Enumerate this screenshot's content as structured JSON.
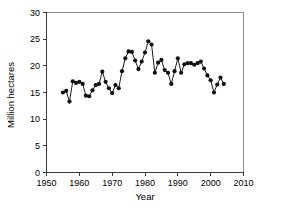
{
  "chart_data": {
    "type": "line",
    "title": "",
    "xlabel": "Year",
    "ylabel": "Million hectares",
    "xlim": [
      1950,
      2010
    ],
    "ylim": [
      0,
      30
    ],
    "xticks": [
      1950,
      1960,
      1970,
      1980,
      1990,
      2000,
      2010
    ],
    "xtick_labels": [
      "1950",
      "1960",
      "1970",
      "1980",
      "1990",
      "2000",
      "2010"
    ],
    "yticks": [
      0,
      5,
      10,
      15,
      20,
      25,
      30
    ],
    "ytick_labels": [
      "0",
      "5",
      "10",
      "15",
      "20",
      "25",
      "30"
    ],
    "grid": false,
    "legend": null,
    "marker": "filled-circle",
    "line_color": "#1a1a1a",
    "marker_color": "#111111",
    "series": [
      {
        "name": "Area harvested",
        "x": [
          1955,
          1956,
          1957,
          1958,
          1959,
          1960,
          1961,
          1962,
          1963,
          1964,
          1965,
          1966,
          1967,
          1968,
          1969,
          1970,
          1971,
          1972,
          1973,
          1974,
          1975,
          1976,
          1977,
          1978,
          1979,
          1980,
          1981,
          1982,
          1983,
          1984,
          1985,
          1986,
          1987,
          1988,
          1989,
          1990,
          1991,
          1992,
          1993,
          1994,
          1995,
          1996,
          1997,
          1998,
          1999,
          2000,
          2001,
          2002,
          2003,
          2004
        ],
        "values": [
          15.0,
          15.3,
          13.3,
          17.1,
          16.8,
          17.0,
          16.6,
          14.4,
          14.3,
          15.4,
          16.4,
          16.6,
          18.9,
          17.0,
          15.8,
          14.9,
          16.4,
          15.8,
          19.0,
          21.4,
          22.7,
          22.6,
          21.0,
          19.4,
          20.8,
          22.5,
          24.6,
          24.0,
          18.7,
          20.6,
          21.1,
          19.2,
          18.7,
          16.6,
          19.0,
          21.4,
          18.7,
          20.3,
          20.5,
          20.5,
          20.2,
          20.5,
          20.8,
          19.5,
          18.2,
          17.3,
          15.0,
          16.5,
          17.8,
          16.6
        ]
      }
    ]
  },
  "axes": {
    "ylabel": "Million hectares",
    "xlabel": "Year"
  }
}
